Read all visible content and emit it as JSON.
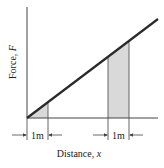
{
  "diagram": {
    "type": "force-vs-distance",
    "y_axis_label": "Force, ",
    "y_axis_var": "F",
    "x_axis_label": "Distance, ",
    "x_axis_var": "x",
    "intervals": [
      {
        "label": "1m",
        "position": "near origin"
      },
      {
        "label": "1m",
        "position": "farther along x"
      }
    ],
    "line": "F increases linearly with x from the origin",
    "colors": {
      "line": "#2a2a2a",
      "axis": "#444444",
      "shade": "#d9d9d9",
      "shade_edge": "#555555"
    }
  }
}
